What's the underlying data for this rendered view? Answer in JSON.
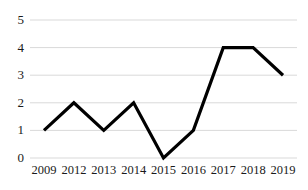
{
  "chart_data": {
    "type": "line",
    "title": "",
    "subtitle": "",
    "xlabel": "",
    "ylabel": "",
    "categories": [
      "2009",
      "2012",
      "2013",
      "2014",
      "2015",
      "2016",
      "2017",
      "2018",
      "2019"
    ],
    "values": [
      1,
      2,
      1,
      2,
      0,
      1,
      4,
      4,
      3
    ],
    "series": [
      {
        "name": "",
        "values": [
          1,
          2,
          1,
          2,
          0,
          1,
          4,
          4,
          3
        ]
      }
    ],
    "ylim": [
      0,
      5
    ],
    "yticks": [
      0,
      1,
      2,
      3,
      4,
      5
    ],
    "ytick_labels": [
      "0",
      "1",
      "2",
      "3",
      "4",
      "5"
    ],
    "xtick_labels": [
      "2009",
      "2012",
      "2013",
      "2014",
      "2015",
      "2016",
      "2017",
      "2018",
      "2019"
    ],
    "grid": true,
    "grid_axis": "y",
    "legend": false,
    "legend_position": "none",
    "markers": false,
    "line_color": "#000000",
    "grid_color": "#d9d9d9",
    "background_color": "#ffffff",
    "text_color": "#1a1a1a",
    "annotations": []
  },
  "plot": {
    "left": 30,
    "right": 297,
    "top": 20,
    "bottom": 158
  }
}
